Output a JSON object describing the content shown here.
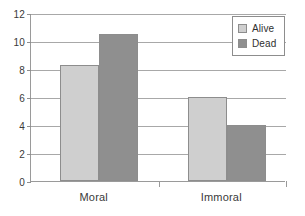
{
  "chart_data": {
    "type": "bar",
    "title": "",
    "subtitle": "",
    "xlabel": "",
    "ylabel": "",
    "categories": [
      "Moral",
      "Immoral"
    ],
    "series": [
      {
        "name": "Alive",
        "values": [
          8.3,
          6.0
        ],
        "color": "#cfcfcf"
      },
      {
        "name": "Dead",
        "values": [
          10.5,
          4.0
        ],
        "color": "#8f8f8f"
      }
    ],
    "ylim": [
      0,
      12
    ],
    "ytick_values": [
      0,
      2,
      4,
      6,
      8,
      10,
      12
    ],
    "ytick_labels": [
      "0",
      "2",
      "4",
      "6",
      "8",
      "10",
      "12"
    ],
    "grid": true,
    "grid_axis": "y",
    "legend_position": "top-right"
  },
  "legend": {
    "entries": [
      {
        "label": "Alive"
      },
      {
        "label": "Dead"
      }
    ]
  },
  "axes": {
    "y": {
      "ticks": [
        {
          "label": "12",
          "value": 12
        },
        {
          "label": "10",
          "value": 10
        },
        {
          "label": "8",
          "value": 8
        },
        {
          "label": "6",
          "value": 6
        },
        {
          "label": "4",
          "value": 4
        },
        {
          "label": "2",
          "value": 2
        },
        {
          "label": "0",
          "value": 0
        }
      ]
    },
    "x": {
      "categories": [
        {
          "label": "Moral"
        },
        {
          "label": "Immoral"
        }
      ]
    }
  },
  "colors": {
    "alive": "#cfcfcf",
    "dead": "#8f8f8f",
    "axis": "#9a9a9a",
    "grid": "#a8a8a8",
    "text": "#3a3a3a",
    "background": "#ffffff"
  }
}
